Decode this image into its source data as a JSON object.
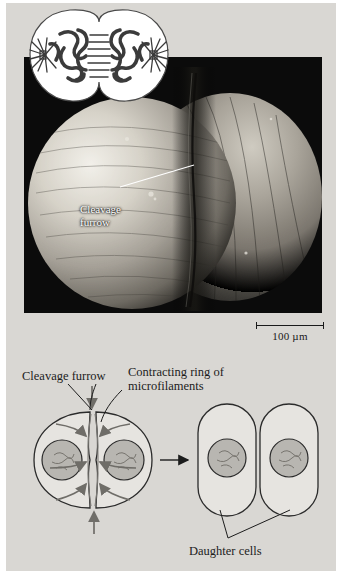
{
  "figure": {
    "type": "textbook-figure",
    "background_color": "#d9d7d3",
    "page_margin_color": "#ffffff"
  },
  "micrograph": {
    "name": "scanning-electron-micrograph-of-dividing-cell",
    "background_color": "#0b0b0b",
    "cell_tone": "#b9b6ae",
    "label": {
      "line1": "Cleavage",
      "line2": "furrow",
      "color": "#ffffff"
    }
  },
  "inset": {
    "name": "mitotic-telophase-inset",
    "fill_color": "#ffffff",
    "stroke_color": "#3a3a3a",
    "description": "two daughter nuclei with chromosomes, asters and midbody fibers"
  },
  "scale_bar": {
    "label": "100 µm",
    "length_px": 68,
    "color": "#1a1a1a"
  },
  "schematic": {
    "labels": {
      "cleavage_furrow": "Cleavage furrow",
      "contracting_ring_line1": "Contracting ring of",
      "contracting_ring_line2": "microfilaments",
      "daughter_cells": "Daughter cells"
    },
    "cell_fill": "#e6e4e0",
    "cell_stroke": "#2b2b2b",
    "nucleus_fill": "#b8b6b1",
    "nucleus_stroke": "#2b2b2b",
    "arrow_color": "#6f6d68",
    "transition_arrow_color": "#1c1c1c",
    "stages": [
      {
        "name": "dividing-cell",
        "nuclei": 2,
        "furrow": true
      },
      {
        "name": "daughter-cells",
        "nuclei": 2,
        "furrow": false
      }
    ]
  }
}
